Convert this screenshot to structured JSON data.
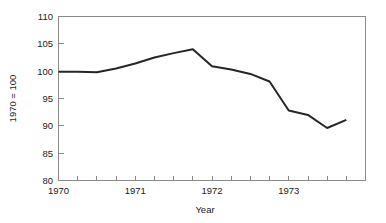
{
  "chart_data": {
    "type": "line",
    "title": "",
    "xlabel": "Year",
    "ylabel": "1970 = 100",
    "xlim": [
      1970.0,
      1974.0
    ],
    "ylim": [
      80,
      110
    ],
    "grid": false,
    "legend": "none",
    "y_ticks": [
      80,
      85,
      90,
      95,
      100,
      105,
      110
    ],
    "y_tick_labels": [
      "80",
      "85",
      "90",
      "95",
      "100",
      "105",
      "110"
    ],
    "x_ticks": [
      1970.0,
      1970.25,
      1970.5,
      1970.75,
      1971.0,
      1971.25,
      1971.5,
      1971.75,
      1972.0,
      1972.25,
      1972.5,
      1972.75,
      1973.0,
      1973.25,
      1973.5,
      1973.75
    ],
    "x_tick_labels": [
      "1970",
      "",
      "",
      "",
      "1971",
      "",
      "",
      "",
      "1972",
      "",
      "",
      "",
      "1973",
      "",
      "",
      ""
    ],
    "x_major_labels": [
      "1970",
      "1971",
      "1972",
      "1973"
    ],
    "x_major_positions": [
      1970.0,
      1971.0,
      1972.0,
      1973.0
    ],
    "series": [
      {
        "name": "index",
        "x": [
          1970.0,
          1970.25,
          1970.5,
          1970.75,
          1971.0,
          1971.25,
          1971.5,
          1971.75,
          1972.0,
          1972.25,
          1972.5,
          1972.75,
          1973.0,
          1973.25,
          1973.5,
          1973.75
        ],
        "values": [
          99.9,
          99.9,
          99.8,
          100.5,
          101.4,
          102.5,
          103.3,
          104.0,
          100.9,
          100.3,
          99.5,
          98.1,
          92.8,
          92.0,
          89.6,
          91.1
        ]
      }
    ]
  },
  "axes": {
    "x_axis_title": "Year",
    "y_axis_title": "1970 = 100"
  }
}
